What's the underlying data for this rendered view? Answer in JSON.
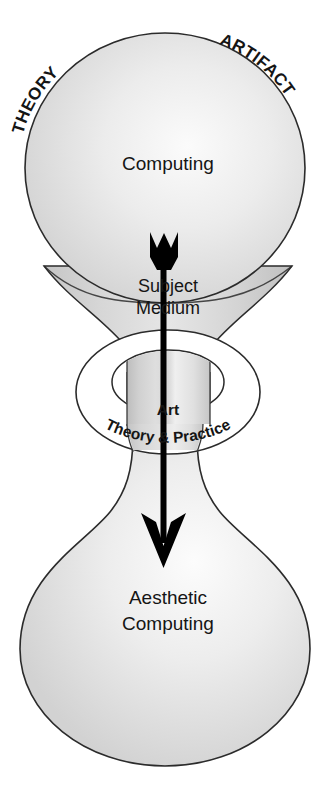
{
  "diagram": {
    "type": "flask-funnel-transformation-diagram",
    "title_text_elements": {
      "top_bulb_label": "Computing",
      "top_arc_left_label": "THEORY",
      "top_arc_right_label": "ARTIFACT",
      "funnel_label_line1": "Subject",
      "funnel_label_line2": "Medium",
      "ring_label_top": "Art",
      "ring_label_bottom": "Theory & Practice",
      "bottom_bulb_label_line1": "Aesthetic",
      "bottom_bulb_label_line2": "Computing"
    },
    "shapes": [
      {
        "name": "top-bulb",
        "role": "source-domain",
        "label": "Computing"
      },
      {
        "name": "funnel-neck",
        "role": "transformation-channel",
        "label": "Subject Medium"
      },
      {
        "name": "torus-ring",
        "role": "mediating-discipline",
        "label": "Art Theory & Practice"
      },
      {
        "name": "bottom-bulb",
        "role": "result-domain",
        "label": "Aesthetic Computing"
      },
      {
        "name": "flow-arrow",
        "role": "direction-of-transformation",
        "label": ""
      }
    ],
    "arrow": {
      "direction": "downward",
      "from": "Computing",
      "to": "Aesthetic Computing"
    },
    "colors": {
      "outline": "#2b2b2b",
      "fill_light": "#f2f2f2",
      "fill_mid": "#dcdcdc",
      "fill_dark": "#c4c4c4",
      "arrow": "#000000",
      "text": "#151515",
      "background": "#ffffff",
      "ring_fill": "#ffffff"
    }
  }
}
